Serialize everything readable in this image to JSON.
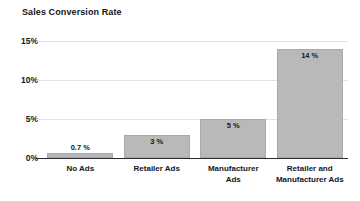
{
  "chart_data": {
    "type": "bar",
    "title": "Sales Conversion Rate",
    "xlabel": "",
    "ylabel": "",
    "categories": [
      "No Ads",
      "Retailer Ads",
      "Manufacturer Ads",
      "Retailer and Manufacturer Ads"
    ],
    "category_lines": [
      [
        "No Ads"
      ],
      [
        "Retailer Ads"
      ],
      [
        "Manufacturer",
        "Ads"
      ],
      [
        "Retailer and",
        "Manufacturer Ads"
      ]
    ],
    "values": [
      0.7,
      3,
      5,
      14
    ],
    "value_labels": [
      "0.7 %",
      "3 %",
      "5 %",
      "14 %"
    ],
    "ylim": [
      0,
      15
    ],
    "yticks": [
      0,
      5,
      10,
      15
    ],
    "ytick_labels": [
      "0%",
      "5%",
      "10%",
      "15%"
    ],
    "grid": true,
    "grid_axis": "y",
    "legend": false,
    "legend_position": "none",
    "colors": {
      "bar_fill": "#b9b9b9",
      "bar_stroke": "#a9a9a9",
      "gridline": "#e2e2e2",
      "axis": "#2b2b33",
      "text": "#15151c",
      "background": "#ffffff"
    }
  }
}
